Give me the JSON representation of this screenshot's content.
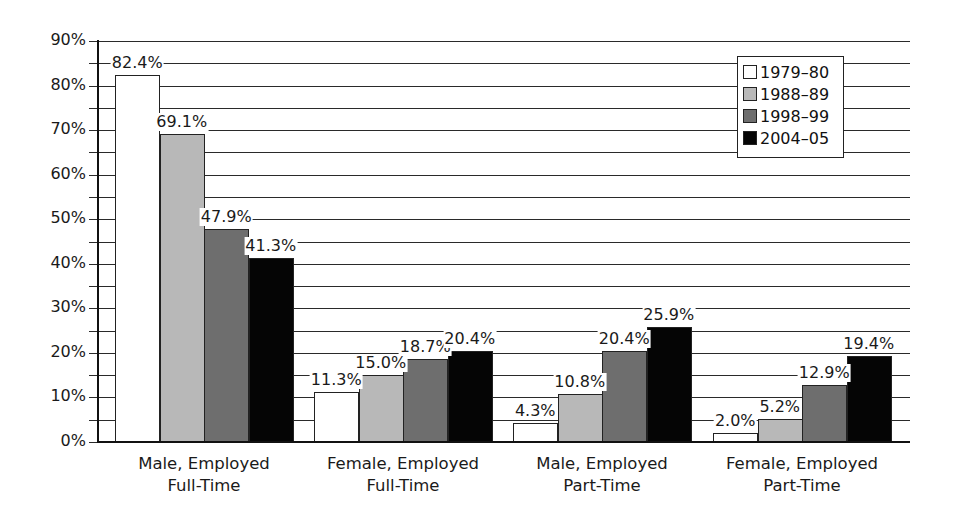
{
  "chart_data": {
    "type": "bar",
    "title": "",
    "xlabel": "",
    "ylabel": "",
    "ylim": [
      0,
      90
    ],
    "yticks": [
      "0%",
      "10%",
      "20%",
      "30%",
      "40%",
      "50%",
      "60%",
      "70%",
      "80%",
      "90%"
    ],
    "grid": true,
    "legend_position": "top-right",
    "categories": [
      [
        "Male, Employed",
        "Full-Time"
      ],
      [
        "Female, Employed",
        "Full-Time"
      ],
      [
        "Male, Employed",
        "Part-Time"
      ],
      [
        "Female, Employed",
        "Part-Time"
      ]
    ],
    "series": [
      {
        "name": "1979–80",
        "color": "#ffffff",
        "values": [
          82.4,
          11.3,
          4.3,
          2.0
        ],
        "labels": [
          "82.4%",
          "11.3%",
          "4.3%",
          "2.0%"
        ]
      },
      {
        "name": "1988–89",
        "color": "#b8b8b8",
        "values": [
          69.1,
          15.0,
          10.8,
          5.2
        ],
        "labels": [
          "69.1%",
          "15.0%",
          "10.8%",
          "5.2%"
        ]
      },
      {
        "name": "1998–99",
        "color": "#6e6e6e",
        "values": [
          47.9,
          18.7,
          20.4,
          12.9
        ],
        "labels": [
          "47.9%",
          "18.7%",
          "20.4%",
          "12.9%"
        ]
      },
      {
        "name": "2004–05",
        "color": "#050505",
        "values": [
          41.3,
          20.4,
          25.9,
          19.4
        ],
        "labels": [
          "41.3%",
          "20.4%",
          "25.9%",
          "19.4%"
        ]
      }
    ]
  }
}
